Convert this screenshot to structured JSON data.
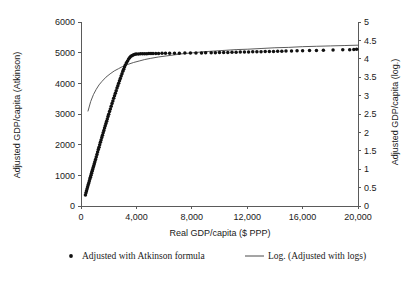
{
  "chart_data": {
    "type": "scatter",
    "title": "",
    "xlabel": "Real GDP/capita ($ PPP)",
    "ylabel": "Adjusted GDP/capita (Atkinson)",
    "y2label": "Adjusted GDP/capita (log.)",
    "xlim": [
      0,
      20000
    ],
    "ylim": [
      0,
      6000
    ],
    "y2lim": [
      0,
      5
    ],
    "grid": false,
    "legend_position": "bottom",
    "x_ticks": [
      0,
      4000,
      8000,
      12000,
      16000,
      20000
    ],
    "x_tick_labels": [
      "0",
      "4,000",
      "8,000",
      "12,000",
      "16,000",
      "20,000"
    ],
    "y_ticks": [
      0,
      1000,
      2000,
      3000,
      4000,
      5000,
      6000
    ],
    "y_tick_labels": [
      "0",
      "1000",
      "2000",
      "3000",
      "4000",
      "5000",
      "6000"
    ],
    "y2_ticks": [
      0,
      0.5,
      1,
      1.5,
      2,
      2.5,
      3,
      3.5,
      4,
      4.5,
      5
    ],
    "y2_tick_labels": [
      "0",
      "0.5",
      "1",
      "1.5",
      "2",
      "2.5",
      "3",
      "3.5",
      "4",
      "4.5",
      "5"
    ],
    "series": [
      {
        "name": "Adjusted with Atkinson formula",
        "type": "scatter",
        "axis": "left",
        "marker": "circle",
        "color": "#111111",
        "points": [
          [
            320,
            360
          ],
          [
            360,
            430
          ],
          [
            400,
            500
          ],
          [
            440,
            560
          ],
          [
            480,
            625
          ],
          [
            520,
            690
          ],
          [
            560,
            750
          ],
          [
            600,
            815
          ],
          [
            640,
            880
          ],
          [
            680,
            940
          ],
          [
            720,
            1000
          ],
          [
            760,
            1065
          ],
          [
            800,
            1130
          ],
          [
            840,
            1190
          ],
          [
            880,
            1255
          ],
          [
            920,
            1315
          ],
          [
            960,
            1380
          ],
          [
            1000,
            1440
          ],
          [
            1050,
            1520
          ],
          [
            1100,
            1600
          ],
          [
            1150,
            1680
          ],
          [
            1200,
            1760
          ],
          [
            1250,
            1840
          ],
          [
            1300,
            1915
          ],
          [
            1350,
            1995
          ],
          [
            1400,
            2075
          ],
          [
            1450,
            2150
          ],
          [
            1500,
            2230
          ],
          [
            1550,
            2305
          ],
          [
            1600,
            2385
          ],
          [
            1650,
            2460
          ],
          [
            1700,
            2540
          ],
          [
            1750,
            2615
          ],
          [
            1800,
            2690
          ],
          [
            1850,
            2765
          ],
          [
            1900,
            2840
          ],
          [
            1950,
            2915
          ],
          [
            2000,
            2990
          ],
          [
            2060,
            3080
          ],
          [
            2120,
            3165
          ],
          [
            2180,
            3255
          ],
          [
            2240,
            3340
          ],
          [
            2300,
            3425
          ],
          [
            2360,
            3510
          ],
          [
            2420,
            3595
          ],
          [
            2480,
            3680
          ],
          [
            2540,
            3760
          ],
          [
            2600,
            3845
          ],
          [
            2660,
            3925
          ],
          [
            2720,
            4005
          ],
          [
            2780,
            4085
          ],
          [
            2840,
            4160
          ],
          [
            2900,
            4240
          ],
          [
            2960,
            4315
          ],
          [
            3020,
            4390
          ],
          [
            3080,
            4460
          ],
          [
            3140,
            4530
          ],
          [
            3200,
            4600
          ],
          [
            3280,
            4670
          ],
          [
            3360,
            4730
          ],
          [
            3440,
            4790
          ],
          [
            3520,
            4840
          ],
          [
            3600,
            4880
          ],
          [
            3700,
            4910
          ],
          [
            3800,
            4930
          ],
          [
            3900,
            4945
          ],
          [
            4000,
            4955
          ],
          [
            4150,
            4960
          ],
          [
            4300,
            4962
          ],
          [
            4450,
            4965
          ],
          [
            4600,
            4967
          ],
          [
            4750,
            4968
          ],
          [
            4900,
            4970
          ],
          [
            5050,
            4971
          ],
          [
            5200,
            4972
          ],
          [
            5400,
            4974
          ],
          [
            5600,
            4975
          ],
          [
            5850,
            4977
          ],
          [
            6100,
            4978
          ],
          [
            6400,
            4980
          ],
          [
            6750,
            4982
          ],
          [
            7100,
            4984
          ],
          [
            7500,
            4986
          ],
          [
            7900,
            4988
          ],
          [
            8300,
            4990
          ],
          [
            8700,
            4993
          ],
          [
            9000,
            4995
          ],
          [
            9400,
            4998
          ],
          [
            9700,
            5000
          ],
          [
            10000,
            5003
          ],
          [
            10300,
            5006
          ],
          [
            10600,
            5009
          ],
          [
            10900,
            5012
          ],
          [
            11200,
            5015
          ],
          [
            11500,
            5018
          ],
          [
            11800,
            5021
          ],
          [
            12100,
            5024
          ],
          [
            12400,
            5027
          ],
          [
            12700,
            5030
          ],
          [
            13000,
            5033
          ],
          [
            13300,
            5036
          ],
          [
            13600,
            5039
          ],
          [
            13900,
            5042
          ],
          [
            14200,
            5045
          ],
          [
            14500,
            5048
          ],
          [
            14800,
            5051
          ],
          [
            15200,
            5055
          ],
          [
            15600,
            5059
          ],
          [
            16000,
            5063
          ],
          [
            16500,
            5068
          ],
          [
            17000,
            5073
          ],
          [
            17500,
            5078
          ],
          [
            18200,
            5085
          ],
          [
            18900,
            5093
          ],
          [
            19400,
            5099
          ],
          [
            19700,
            5104
          ],
          [
            19900,
            5108
          ]
        ]
      },
      {
        "name": "Log. (Adjusted with logs)",
        "type": "line",
        "axis": "right",
        "color": "#4a4a4a",
        "points": [
          [
            500,
            2.57
          ],
          [
            700,
            2.84
          ],
          [
            900,
            3.03
          ],
          [
            1100,
            3.17
          ],
          [
            1300,
            3.29
          ],
          [
            1500,
            3.38
          ],
          [
            1800,
            3.5
          ],
          [
            2100,
            3.59
          ],
          [
            2400,
            3.67
          ],
          [
            2700,
            3.73
          ],
          [
            3000,
            3.79
          ],
          [
            3400,
            3.85
          ],
          [
            3800,
            3.9
          ],
          [
            4200,
            3.94
          ],
          [
            4600,
            3.98
          ],
          [
            5000,
            4.01
          ],
          [
            5600,
            4.05
          ],
          [
            6200,
            4.08
          ],
          [
            6800,
            4.11
          ],
          [
            7400,
            4.14
          ],
          [
            8000,
            4.16
          ],
          [
            8800,
            4.19
          ],
          [
            9600,
            4.21
          ],
          [
            10400,
            4.23
          ],
          [
            11200,
            4.25
          ],
          [
            12000,
            4.26
          ],
          [
            13000,
            4.28
          ],
          [
            14000,
            4.3
          ],
          [
            15000,
            4.31
          ],
          [
            16000,
            4.33
          ],
          [
            17000,
            4.34
          ],
          [
            18000,
            4.35
          ],
          [
            19000,
            4.36
          ],
          [
            20000,
            4.37
          ]
        ]
      }
    ],
    "legend": [
      {
        "label": "Adjusted with Atkinson formula",
        "marker": "dot",
        "color": "#111111"
      },
      {
        "label": "Log. (Adjusted with logs)",
        "marker": "line",
        "color": "#4a4a4a"
      }
    ]
  },
  "caption": {
    "fragment": ""
  }
}
